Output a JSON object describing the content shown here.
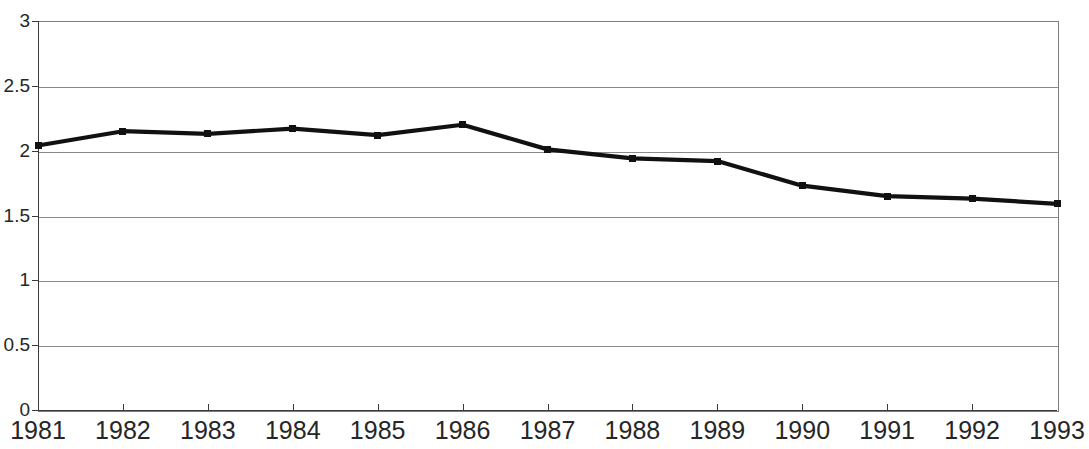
{
  "chart_data": {
    "type": "line",
    "title": "",
    "xlabel": "",
    "ylabel": "",
    "categories": [
      "1981",
      "1982",
      "1983",
      "1984",
      "1985",
      "1986",
      "1987",
      "1988",
      "1989",
      "1990",
      "1991",
      "1992",
      "1993"
    ],
    "values": [
      2.04,
      2.15,
      2.13,
      2.17,
      2.12,
      2.2,
      2.01,
      1.94,
      1.92,
      1.73,
      1.65,
      1.63,
      1.59
    ],
    "series": [
      {
        "name": "",
        "values": [
          2.04,
          2.15,
          2.13,
          2.17,
          2.12,
          2.2,
          2.01,
          1.94,
          1.92,
          1.73,
          1.65,
          1.63,
          1.59
        ]
      }
    ],
    "ylim": [
      0,
      3
    ],
    "ytick_labels": [
      "0",
      "0.5",
      "1",
      "1.5",
      "2",
      "2.5",
      "3"
    ],
    "ytick_values": [
      0,
      0.5,
      1,
      1.5,
      2,
      2.5,
      3
    ],
    "xtick_labels": [
      "1981",
      "1982",
      "1983",
      "1984",
      "1985",
      "1986",
      "1987",
      "1988",
      "1989",
      "1990",
      "1991",
      "1992",
      "1993"
    ],
    "grid": true,
    "grid_axis": "y",
    "legend": false,
    "legend_position": "none",
    "marker": "square",
    "line_color": "#111111",
    "marker_color": "#111111",
    "grid_color": "#8a8a8a",
    "axis_color": "#3a3a3a",
    "background_color": "#ffffff",
    "annotations": []
  }
}
